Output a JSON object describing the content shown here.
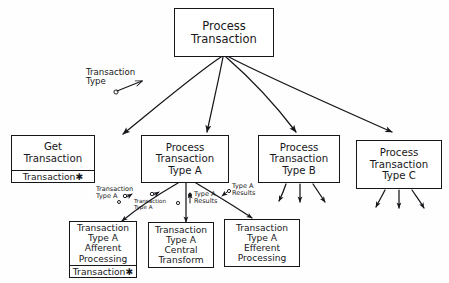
{
  "diagram": {
    "type": "structure-chart",
    "style": "hand-drawn",
    "ink_color": "#15151a",
    "paper_color": "#fefefe"
  },
  "modules": [
    {
      "id": "process-transaction",
      "lines": [
        "Process",
        "Transaction"
      ],
      "compartment": null
    },
    {
      "id": "get-transaction",
      "lines": [
        "Get",
        "Transaction"
      ],
      "compartment": "Transaction✱"
    },
    {
      "id": "process-transaction-type-a",
      "lines": [
        "Process",
        "Transaction",
        "Type A"
      ],
      "compartment": null
    },
    {
      "id": "process-transaction-type-b",
      "lines": [
        "Process",
        "Transaction",
        "Type B"
      ],
      "compartment": null
    },
    {
      "id": "process-transaction-type-c",
      "lines": [
        "Process",
        "Transaction",
        "Type C"
      ],
      "compartment": null
    },
    {
      "id": "type-a-afferent-processing",
      "lines": [
        "Transaction",
        "Type A",
        "Afferent",
        "Processing"
      ],
      "compartment": "Transaction✱"
    },
    {
      "id": "type-a-central-transform",
      "lines": [
        "Transaction",
        "Type A",
        "Central",
        "Transform"
      ],
      "compartment": null
    },
    {
      "id": "type-a-efferent-processing",
      "lines": [
        "Transaction",
        "Type A",
        "Efferent",
        "Processing"
      ],
      "compartment": null
    }
  ],
  "couples": [
    {
      "id": "transaction-type",
      "lines": [
        "Transaction",
        "Type"
      ]
    },
    {
      "id": "transaction-type-a-1",
      "lines": [
        "Transaction",
        "Type A"
      ]
    },
    {
      "id": "transaction-type-a-2",
      "lines": [
        "Transaction",
        "Type A"
      ]
    },
    {
      "id": "type-a-results-1",
      "lines": [
        "Type A",
        "Results"
      ]
    },
    {
      "id": "type-a-results-2",
      "lines": [
        "Type A",
        "Results"
      ]
    }
  ]
}
